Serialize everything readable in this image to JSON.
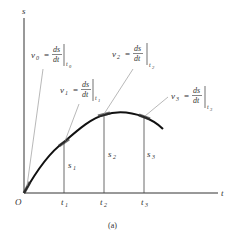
{
  "figure": {
    "caption": "(a)",
    "axes": {
      "y_label": "s",
      "x_label": "t",
      "origin_label": "O"
    },
    "time_ticks": [
      {
        "label": "t",
        "sub": "1"
      },
      {
        "label": "t",
        "sub": "2"
      },
      {
        "label": "t",
        "sub": "3"
      }
    ],
    "position_markers": [
      {
        "label": "s",
        "sub": "1"
      },
      {
        "label": "s",
        "sub": "2"
      },
      {
        "label": "s",
        "sub": "3"
      }
    ],
    "velocity_annotations": [
      {
        "v": "v",
        "v_sub": "0",
        "eq": "=",
        "num": "ds",
        "den": "dt",
        "eval": "t",
        "eval_sub": "0"
      },
      {
        "v": "v",
        "v_sub": "1",
        "eq": "=",
        "num": "ds",
        "den": "dt",
        "eval": "t",
        "eval_sub": "1"
      },
      {
        "v": "v",
        "v_sub": "2",
        "eq": "=",
        "num": "ds",
        "den": "dt",
        "eval": "t",
        "eval_sub": "2"
      },
      {
        "v": "v",
        "v_sub": "3",
        "eq": "=",
        "num": "ds",
        "den": "dt",
        "eval": "t",
        "eval_sub": "3"
      }
    ]
  }
}
